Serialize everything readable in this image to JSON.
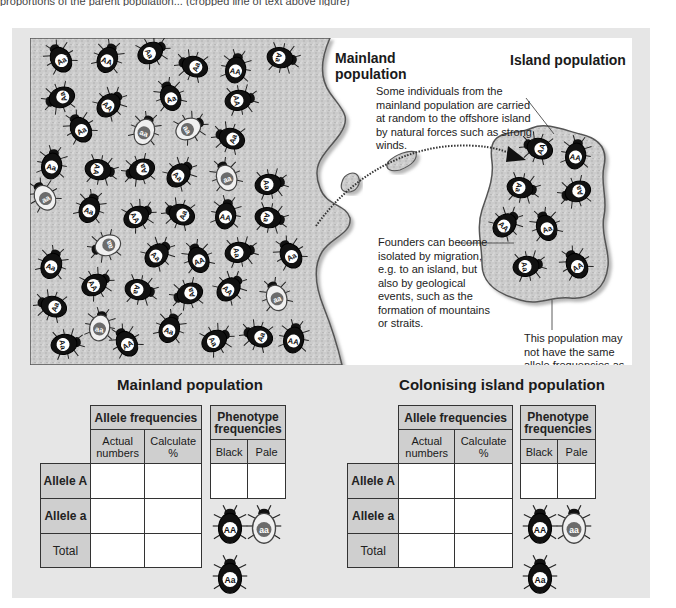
{
  "top_caption": "proportions of the parent population... (cropped line of text above figure)",
  "illustration": {
    "mainland_label": "Mainland population",
    "island_label": "Island population",
    "note_migration": "Some individuals from the mainland population are carried at random to the offshore island by natural forces such as strong winds.",
    "note_founders": "Founders can become isolated by migration, e.g. to an island, but also by geological events, such as the formation of mountains or straits.",
    "note_frequencies": "This population may not have the same allele frequencies as the mainland population.",
    "mainland_beetles": [
      {
        "x": 30,
        "y": 20,
        "g": "Aa"
      },
      {
        "x": 78,
        "y": 20,
        "g": "AA"
      },
      {
        "x": 122,
        "y": 14,
        "g": "Aa"
      },
      {
        "x": 163,
        "y": 28,
        "g": "Aa"
      },
      {
        "x": 206,
        "y": 30,
        "g": "AA"
      },
      {
        "x": 252,
        "y": 20,
        "g": "Aa"
      },
      {
        "x": 30,
        "y": 60,
        "g": "Aa"
      },
      {
        "x": 80,
        "y": 66,
        "g": "AA"
      },
      {
        "x": 140,
        "y": 58,
        "g": "Aa"
      },
      {
        "x": 210,
        "y": 62,
        "g": "AA"
      },
      {
        "x": 50,
        "y": 90,
        "g": "Aa"
      },
      {
        "x": 115,
        "y": 92,
        "g": "aa"
      },
      {
        "x": 160,
        "y": 90,
        "g": "aa"
      },
      {
        "x": 200,
        "y": 100,
        "g": "Aa"
      },
      {
        "x": 22,
        "y": 126,
        "g": "Aa"
      },
      {
        "x": 70,
        "y": 132,
        "g": "AA"
      },
      {
        "x": 110,
        "y": 132,
        "g": "Aa"
      },
      {
        "x": 150,
        "y": 136,
        "g": "Aa"
      },
      {
        "x": 196,
        "y": 138,
        "g": "aa"
      },
      {
        "x": 240,
        "y": 146,
        "g": "Aa"
      },
      {
        "x": 14,
        "y": 158,
        "g": "aa"
      },
      {
        "x": 60,
        "y": 170,
        "g": "Aa"
      },
      {
        "x": 108,
        "y": 178,
        "g": "AA"
      },
      {
        "x": 150,
        "y": 176,
        "g": "Aa"
      },
      {
        "x": 196,
        "y": 176,
        "g": "AA"
      },
      {
        "x": 240,
        "y": 180,
        "g": "Aa"
      },
      {
        "x": 76,
        "y": 208,
        "g": "aa"
      },
      {
        "x": 128,
        "y": 216,
        "g": "Aa"
      },
      {
        "x": 168,
        "y": 220,
        "g": "AA"
      },
      {
        "x": 210,
        "y": 214,
        "g": "Aa"
      },
      {
        "x": 260,
        "y": 216,
        "g": "Aa"
      },
      {
        "x": 22,
        "y": 226,
        "g": "Aa"
      },
      {
        "x": 66,
        "y": 246,
        "g": "AA"
      },
      {
        "x": 22,
        "y": 268,
        "g": "Aa"
      },
      {
        "x": 70,
        "y": 288,
        "g": "aa"
      },
      {
        "x": 110,
        "y": 252,
        "g": "Aa"
      },
      {
        "x": 158,
        "y": 256,
        "g": "Aa"
      },
      {
        "x": 200,
        "y": 250,
        "g": "AA"
      },
      {
        "x": 246,
        "y": 258,
        "g": "aa"
      },
      {
        "x": 36,
        "y": 306,
        "g": "Aa"
      },
      {
        "x": 96,
        "y": 304,
        "g": "AA"
      },
      {
        "x": 140,
        "y": 290,
        "g": "Aa"
      },
      {
        "x": 186,
        "y": 302,
        "g": "Aa"
      },
      {
        "x": 228,
        "y": 298,
        "g": "Aa"
      },
      {
        "x": 264,
        "y": 300,
        "g": "AA"
      }
    ],
    "island_beetles": [
      {
        "x": 508,
        "y": 110,
        "g": "AA"
      },
      {
        "x": 546,
        "y": 116,
        "g": "AA"
      },
      {
        "x": 492,
        "y": 150,
        "g": "Aa"
      },
      {
        "x": 546,
        "y": 154,
        "g": "Aa"
      },
      {
        "x": 476,
        "y": 186,
        "g": "AA"
      },
      {
        "x": 516,
        "y": 188,
        "g": "Aa"
      },
      {
        "x": 498,
        "y": 228,
        "g": "Aa"
      },
      {
        "x": 546,
        "y": 226,
        "g": "AA"
      }
    ]
  },
  "tables": [
    {
      "title": "Mainland population",
      "allele_header": "Allele frequencies",
      "col_actual": "Actual numbers",
      "col_calc": "Calculate %",
      "phenotype_header": "Phenotype frequencies",
      "col_black": "Black",
      "col_pale": "Pale",
      "rows": [
        "Allele A",
        "Allele a",
        "Total"
      ],
      "values": [
        [
          "",
          ""
        ],
        [
          "",
          ""
        ],
        [
          "",
          ""
        ]
      ],
      "phenotype_values": [
        "",
        ""
      ],
      "key_beetles": [
        "AA",
        "aa",
        "Aa"
      ]
    },
    {
      "title": "Colonising island population",
      "allele_header": "Allele frequencies",
      "col_actual": "Actual numbers",
      "col_calc": "Calculate %",
      "phenotype_header": "Phenotype frequencies",
      "col_black": "Black",
      "col_pale": "Pale",
      "rows": [
        "Allele A",
        "Allele a",
        "Total"
      ],
      "values": [
        [
          "",
          ""
        ],
        [
          "",
          ""
        ],
        [
          "",
          ""
        ]
      ],
      "phenotype_values": [
        "",
        ""
      ],
      "key_beetles": [
        "AA",
        "aa",
        "Aa"
      ]
    }
  ],
  "colors": {
    "frame_bg": "#e6e6e6",
    "land_fill": "#c9c9c9",
    "table_header_bg": "#cfcfcf",
    "black_beetle": "#111111",
    "pale_beetle_center": "#6b6b6b"
  }
}
